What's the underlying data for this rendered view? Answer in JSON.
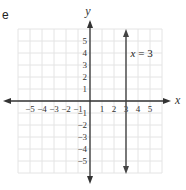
{
  "part_label": "e",
  "chart_data": {
    "type": "line",
    "title": "",
    "xlabel": "x",
    "ylabel": "y",
    "xlim": [
      -6,
      6
    ],
    "ylim": [
      -6,
      6
    ],
    "grid": true,
    "x_ticks": [
      -5,
      -4,
      -3,
      -2,
      -1,
      1,
      2,
      3,
      4,
      5
    ],
    "x_tick_labels": [
      "−5",
      "−4",
      "−3",
      "−2",
      "−1",
      "1",
      "2",
      "3",
      "4",
      "5"
    ],
    "y_ticks": [
      5,
      4,
      3,
      2,
      1,
      -1,
      -2,
      -3,
      -4,
      -5
    ],
    "y_tick_labels": [
      "5",
      "4",
      "3",
      "2",
      "1",
      "−1",
      "−2",
      "−3",
      "−4",
      "−5"
    ],
    "series": [
      {
        "name": "x = 3",
        "kind": "vertical_line",
        "x": 3,
        "y_range": [
          -6,
          6
        ],
        "arrows": "both"
      }
    ],
    "annotations": [
      {
        "text": "x = 3",
        "x": 3.3,
        "y": 4
      }
    ],
    "colors": {
      "line": "#444444",
      "grid": "#e4e4e4",
      "axis": "#333333"
    }
  }
}
